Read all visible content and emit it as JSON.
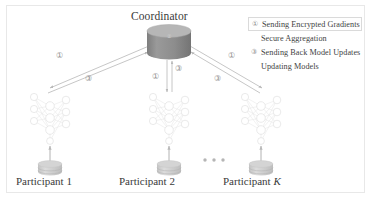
{
  "figure": {
    "background_color": "#ffffff",
    "border_color": "#e8e8e8"
  },
  "coordinator": {
    "label": "Coordinator",
    "shape": "cylinder",
    "fill_color": "#8f8f8f",
    "top_color": "#b4b4b4",
    "marker": "②"
  },
  "participants": [
    {
      "label_prefix": "Participant",
      "label_suffix": "1",
      "suffix_italic": false
    },
    {
      "label_prefix": "Participant",
      "label_suffix": "2",
      "suffix_italic": false
    },
    {
      "label_prefix": "Participant",
      "label_suffix": "K",
      "suffix_italic": true
    }
  ],
  "ellipsis": "• • •",
  "flow_markers": {
    "left_outbound": "①",
    "left_inbound": "③",
    "center_outbound": "①",
    "center_inbound": "③",
    "right_outbound": "①",
    "right_inbound": "③"
  },
  "legend": {
    "items": [
      {
        "marker": "①",
        "label": "Sending Encrypted Gradients",
        "boxed": true
      },
      {
        "marker": "②",
        "label": "Secure Aggregation",
        "boxed": false
      },
      {
        "marker": "③",
        "label": "Sending Back Model Updates",
        "boxed": false
      },
      {
        "marker": "④",
        "label": "Updating Models",
        "boxed": false
      }
    ]
  },
  "colors": {
    "node_stroke": "#d8d8d8",
    "edge_stroke": "#e4e4e4",
    "arrow_stroke": "#b8b8b8",
    "database_fill": "#cfcfcf",
    "text": "#3a3a3a"
  }
}
